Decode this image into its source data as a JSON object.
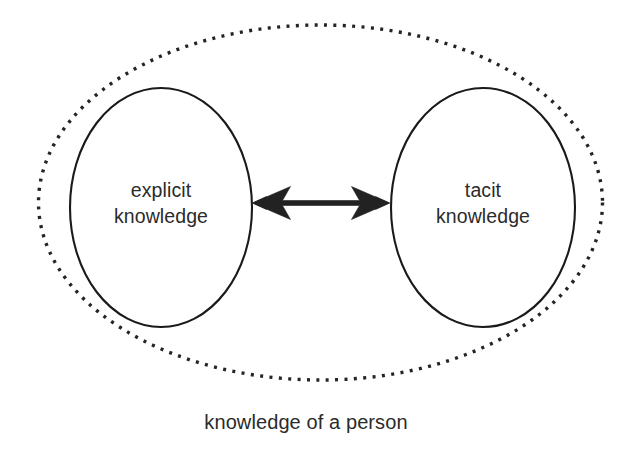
{
  "diagram": {
    "title": "knowledge of a person",
    "background_color": "#ffffff",
    "stroke_color": "#1a1a1a",
    "arrow_color": "#222222",
    "text_color": "#2b2b2b",
    "outer_boundary": {
      "name": "knowledge of a person",
      "style": "dotted-ellipse"
    },
    "nodes": [
      {
        "id": "explicit",
        "line1": "explicit",
        "line2": "knowledge",
        "full_label": "explicit knowledge",
        "style": "solid-ellipse"
      },
      {
        "id": "tacit",
        "line1": "tacit",
        "line2": "knowledge",
        "full_label": "tacit knowledge",
        "style": "solid-ellipse"
      }
    ],
    "connector": {
      "id": "explicit-tacit-link",
      "type": "double-headed-arrow",
      "from": "explicit",
      "to": "tacit",
      "label": ""
    },
    "caption": "knowledge of a person"
  }
}
